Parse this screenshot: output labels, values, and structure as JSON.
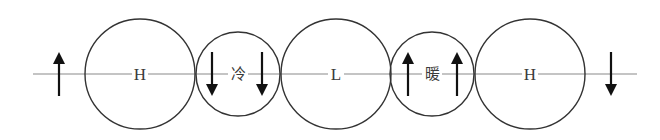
{
  "diagram": {
    "axis": {
      "x1": 33,
      "x2": 637,
      "y": 74,
      "color": "#8a8a8a"
    },
    "circles": [
      {
        "id": "high-1",
        "cx": 140,
        "cy": 74,
        "r": 55,
        "label": "H"
      },
      {
        "id": "cold-front",
        "cx": 238,
        "cy": 74,
        "r": 42,
        "label": "冷"
      },
      {
        "id": "low",
        "cx": 336,
        "cy": 74,
        "r": 55,
        "label": "L"
      },
      {
        "id": "warm-front",
        "cx": 432,
        "cy": 74,
        "r": 42,
        "label": "暖"
      },
      {
        "id": "high-2",
        "cx": 530,
        "cy": 74,
        "r": 55,
        "label": "H"
      }
    ],
    "arrows": [
      {
        "x": 59,
        "direction": "up"
      },
      {
        "x": 212,
        "direction": "down"
      },
      {
        "x": 262,
        "direction": "down"
      },
      {
        "x": 408,
        "direction": "up"
      },
      {
        "x": 457,
        "direction": "up"
      },
      {
        "x": 611,
        "direction": "down"
      }
    ],
    "stroke_color": "#333333",
    "arrow_color": "#111111"
  }
}
